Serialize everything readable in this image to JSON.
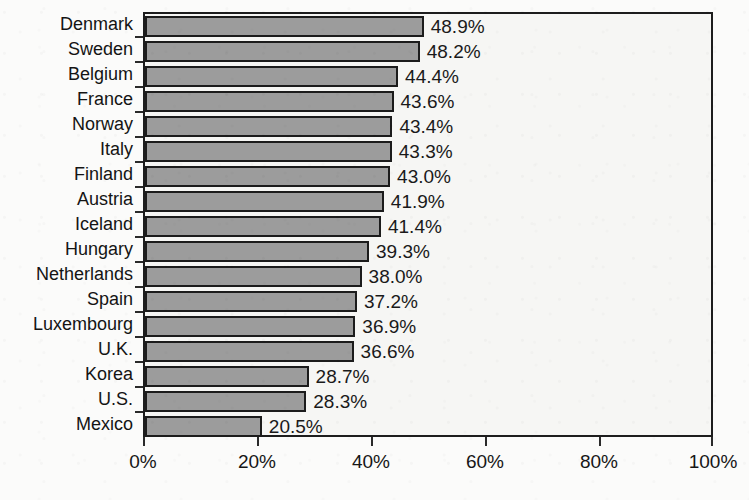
{
  "chart_data": {
    "type": "bar",
    "orientation": "horizontal",
    "title": "",
    "subtitle": "",
    "xlabel": "",
    "ylabel": "",
    "xlim": [
      0,
      100
    ],
    "grid": false,
    "legend": false,
    "categories": [
      "Denmark",
      "Sweden",
      "Belgium",
      "France",
      "Norway",
      "Italy",
      "Finland",
      "Austria",
      "Iceland",
      "Hungary",
      "Netherlands",
      "Spain",
      "Luxembourg",
      "U.K.",
      "Korea",
      "U.S.",
      "Mexico"
    ],
    "values": [
      48.9,
      48.2,
      44.4,
      43.6,
      43.4,
      43.3,
      43.0,
      41.9,
      41.4,
      39.3,
      38.0,
      37.2,
      36.9,
      36.6,
      28.7,
      28.3,
      20.5
    ],
    "data_labels": [
      "48.9%",
      "48.2%",
      "44.4%",
      "43.6%",
      "43.4%",
      "43.3%",
      "43.0%",
      "41.9%",
      "41.4%",
      "39.3%",
      "38.0%",
      "37.2%",
      "36.9%",
      "36.6%",
      "28.7%",
      "28.3%",
      "20.5%"
    ],
    "xticks": [
      0,
      20,
      40,
      60,
      80,
      100
    ],
    "xtick_labels": [
      "0%",
      "20%",
      "40%",
      "60%",
      "80%",
      "100%"
    ],
    "colors": {
      "bar_fill": "#9c9c9c",
      "bar_border": "#1c1c1c",
      "plot_background": "#f6f6f4",
      "page_background": "#fbfbfa",
      "axis": "#1d1d1d",
      "text": "#141414"
    }
  }
}
